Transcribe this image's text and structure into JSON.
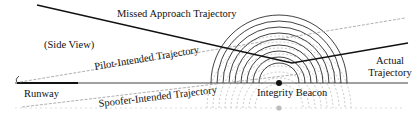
{
  "diagram": {
    "view_label": "(Side View)",
    "labels": {
      "missed_approach": "Missed Approach Trajectory",
      "pilot_intended": "Pilot-Intended Trajectory",
      "spoofer_intended": "Spoofer-Intended Trajectory",
      "runway": "Runway",
      "integrity_beacon": "Integrity Beacon",
      "actual_line1": "Actual",
      "actual_line2": "Trajectory"
    },
    "colors": {
      "solid": "#111111",
      "dashed": "#9a9a9a",
      "reflection": "#b5b5b5"
    },
    "beacon": {
      "x": 279,
      "y": 83,
      "mirror_y": 108
    },
    "ground_y": 83,
    "arc_radii": [
      20,
      26,
      32,
      38,
      44,
      50,
      56,
      62,
      68
    ]
  }
}
